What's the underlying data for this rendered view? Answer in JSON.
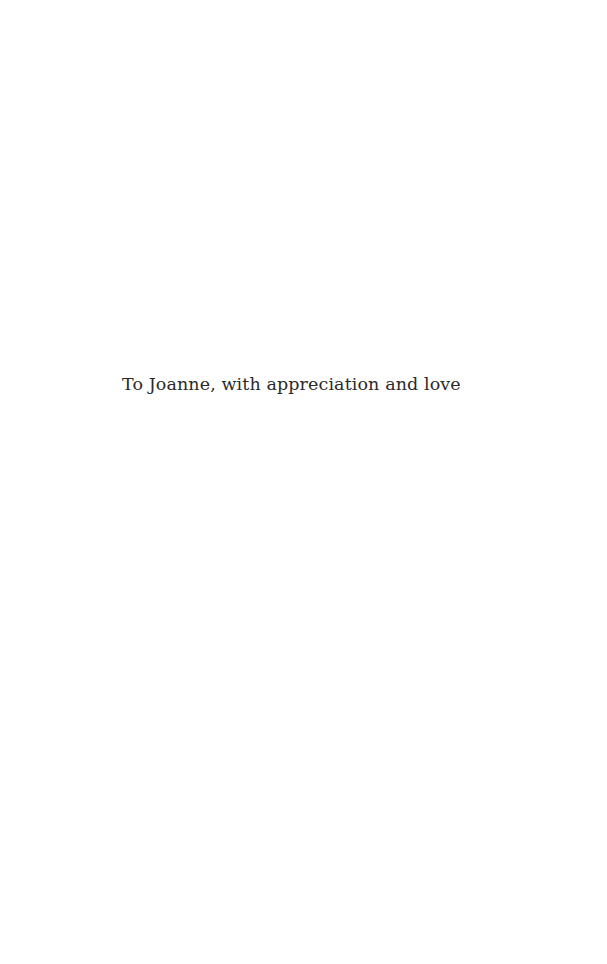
{
  "page": {
    "background_color": "#ffffff",
    "text_color": "#2b2b2b",
    "dedication": "To Joanne, with appreciation and love"
  }
}
